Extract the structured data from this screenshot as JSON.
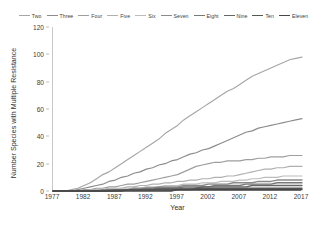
{
  "chart_data": {
    "type": "line",
    "title": "",
    "xlabel": "Year",
    "ylabel": "Number Species with Multiple Resistance",
    "xlim": [
      1977,
      2017
    ],
    "ylim": [
      0,
      120
    ],
    "xticks": [
      1977,
      1982,
      1987,
      1992,
      1997,
      2002,
      2007,
      2012,
      2017
    ],
    "yticks": [
      0,
      20,
      40,
      60,
      80,
      100,
      120
    ],
    "grid": false,
    "legend_position": "top",
    "x": [
      1977,
      1978,
      1979,
      1980,
      1981,
      1982,
      1983,
      1984,
      1985,
      1986,
      1987,
      1988,
      1989,
      1990,
      1991,
      1992,
      1993,
      1994,
      1995,
      1996,
      1997,
      1998,
      1999,
      2000,
      2001,
      2002,
      2003,
      2004,
      2005,
      2006,
      2007,
      2008,
      2009,
      2010,
      2011,
      2012,
      2013,
      2014,
      2015,
      2016,
      2017
    ],
    "series": [
      {
        "name": "Two",
        "color": "#a6a6a6",
        "values": [
          0,
          0,
          0,
          1,
          2,
          4,
          6,
          9,
          12,
          14,
          17,
          20,
          23,
          26,
          29,
          32,
          35,
          38,
          42,
          45,
          48,
          52,
          55,
          58,
          61,
          64,
          67,
          70,
          73,
          75,
          78,
          81,
          84,
          86,
          88,
          90,
          92,
          94,
          96,
          97,
          98
        ]
      },
      {
        "name": "Three",
        "color": "#8c8c8c",
        "values": [
          0,
          0,
          0,
          0,
          1,
          2,
          3,
          4,
          5,
          7,
          8,
          10,
          11,
          13,
          14,
          16,
          17,
          19,
          20,
          22,
          23,
          25,
          27,
          28,
          30,
          31,
          33,
          35,
          37,
          39,
          41,
          43,
          44,
          46,
          47,
          48,
          49,
          50,
          51,
          52,
          53
        ]
      },
      {
        "name": "Four",
        "color": "#9e9e9e",
        "values": [
          0,
          0,
          0,
          0,
          0,
          1,
          1,
          2,
          2,
          3,
          3,
          4,
          5,
          5,
          6,
          7,
          8,
          9,
          10,
          11,
          12,
          14,
          16,
          18,
          19,
          20,
          21,
          21,
          22,
          22,
          22,
          23,
          23,
          24,
          24,
          25,
          25,
          25,
          26,
          26,
          26
        ]
      },
      {
        "name": "Five",
        "color": "#b0b0b0",
        "values": [
          0,
          0,
          0,
          0,
          0,
          0,
          1,
          1,
          1,
          2,
          2,
          2,
          3,
          3,
          4,
          4,
          5,
          5,
          6,
          6,
          7,
          7,
          8,
          8,
          9,
          9,
          10,
          10,
          11,
          11,
          12,
          13,
          14,
          15,
          16,
          16,
          17,
          17,
          18,
          18,
          18
        ]
      },
      {
        "name": "Six",
        "color": "#bcbcbc",
        "values": [
          0,
          0,
          0,
          0,
          0,
          0,
          0,
          1,
          1,
          1,
          1,
          2,
          2,
          2,
          2,
          3,
          3,
          3,
          4,
          4,
          4,
          5,
          5,
          5,
          6,
          6,
          6,
          7,
          7,
          7,
          8,
          8,
          9,
          9,
          10,
          10,
          10,
          11,
          11,
          11,
          11
        ]
      },
      {
        "name": "Seven",
        "color": "#8a8a8a",
        "values": [
          0,
          0,
          0,
          0,
          0,
          0,
          0,
          0,
          1,
          1,
          1,
          1,
          1,
          2,
          2,
          2,
          2,
          3,
          3,
          3,
          3,
          4,
          4,
          4,
          4,
          5,
          5,
          5,
          5,
          6,
          6,
          6,
          6,
          7,
          7,
          7,
          8,
          8,
          8,
          8,
          8
        ]
      },
      {
        "name": "Eight",
        "color": "#777777",
        "values": [
          0,
          0,
          0,
          0,
          0,
          0,
          0,
          0,
          0,
          1,
          1,
          1,
          1,
          1,
          1,
          2,
          2,
          2,
          2,
          2,
          2,
          3,
          3,
          3,
          3,
          3,
          4,
          4,
          4,
          4,
          4,
          5,
          5,
          5,
          5,
          5,
          6,
          6,
          6,
          6,
          6
        ]
      },
      {
        "name": "Nine",
        "color": "#666666",
        "values": [
          0,
          0,
          0,
          0,
          0,
          0,
          0,
          0,
          0,
          0,
          1,
          1,
          1,
          1,
          1,
          1,
          1,
          2,
          2,
          2,
          2,
          2,
          2,
          2,
          3,
          3,
          3,
          3,
          3,
          3,
          3,
          3,
          4,
          4,
          4,
          4,
          4,
          4,
          4,
          4,
          4
        ]
      },
      {
        "name": "Ten",
        "color": "#565656",
        "values": [
          0,
          0,
          0,
          0,
          0,
          0,
          0,
          0,
          0,
          0,
          0,
          0,
          1,
          1,
          1,
          1,
          1,
          1,
          1,
          1,
          1,
          1,
          1,
          2,
          2,
          2,
          2,
          2,
          2,
          2,
          2,
          2,
          2,
          2,
          2,
          2,
          2,
          2,
          2,
          2,
          2
        ]
      },
      {
        "name": "Eleven",
        "color": "#474747",
        "values": [
          0,
          0,
          0,
          0,
          0,
          0,
          0,
          0,
          0,
          0,
          0,
          0,
          0,
          0,
          0,
          0,
          0,
          0,
          0,
          0,
          1,
          1,
          1,
          1,
          1,
          1,
          1,
          1,
          1,
          1,
          1,
          1,
          1,
          1,
          1,
          1,
          1,
          1,
          1,
          1,
          1
        ]
      }
    ]
  },
  "axes": {
    "y_title": "Number Species with Multiple Resistance",
    "x_title": "Year",
    "y_tick_labels": [
      "120",
      "100",
      "80",
      "60",
      "40",
      "20",
      "0"
    ],
    "x_tick_labels": [
      "1977",
      "1982",
      "1987",
      "1992",
      "1997",
      "2002",
      "2007",
      "2012",
      "2017"
    ]
  },
  "legend": {
    "items": [
      {
        "label": "Two"
      },
      {
        "label": "Three"
      },
      {
        "label": "Four"
      },
      {
        "label": "Five"
      },
      {
        "label": "Six"
      },
      {
        "label": "Seven"
      },
      {
        "label": "Eight"
      },
      {
        "label": "Nine"
      },
      {
        "label": "Ten"
      },
      {
        "label": "Eleven"
      }
    ]
  },
  "colors": {
    "axis": "#7a7a7a",
    "axis_light": "#c8c8c8",
    "text": "#404040",
    "background": "#ffffff"
  }
}
